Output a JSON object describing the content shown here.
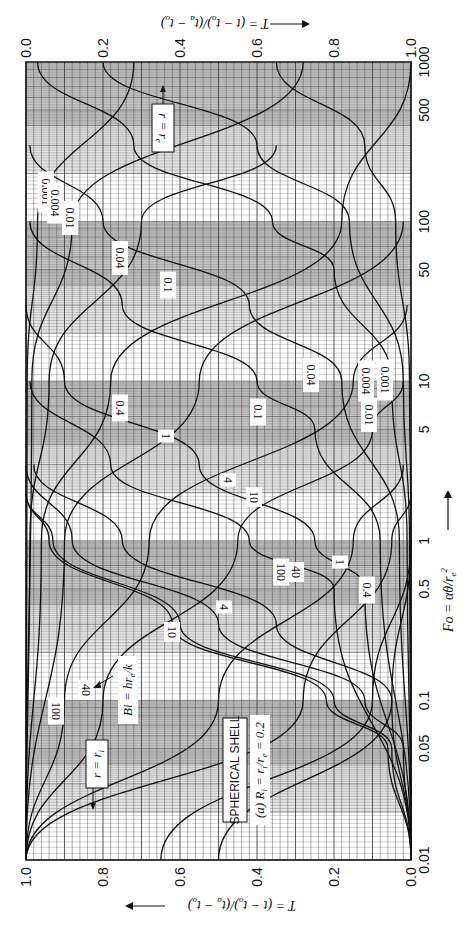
{
  "chart_data": {
    "type": "line",
    "orientation": "rotated-90-cw",
    "title": "SPHERICAL SHELL",
    "subtitle": "(a) R_i = r_i/r_e = 0.2",
    "parameter_label": "Bi = h r_e / k",
    "xlabel": "Fo = αθ/r_e²",
    "x_scale": "log",
    "xlim": [
      0.01,
      1000
    ],
    "x_ticks": [
      "0.01",
      "0.05",
      "0.1",
      "0.5",
      "1",
      "5",
      "10",
      "50",
      "100",
      "500",
      "1000"
    ],
    "ylabel_bottom": "T = (t − t_o)/(t_a − t_o)",
    "ylabel_top": "T = (t − t_o)/(t_a − t_o)",
    "y_ticks_bottom": [
      "1.0",
      "0.8",
      "0.6",
      "0.4",
      "0.2",
      "0.0"
    ],
    "y_ticks_top": [
      "0.0",
      "0.2",
      "0.4",
      "0.6",
      "0.8",
      "1.0"
    ],
    "ylim": [
      0,
      1
    ],
    "grid": true,
    "shaded_bands": "alternating decades",
    "curve_families": [
      {
        "name": "r = r_i",
        "label": "r = r_i",
        "axis": "bottom (T increases right to left)",
        "series": [
          {
            "name": "Bi=0.001",
            "x": [
              0.01,
              1,
              10,
              100,
              300,
              1000
            ],
            "y": [
              0.0,
              0.0,
              0.004,
              0.04,
              0.12,
              0.35
            ]
          },
          {
            "name": "Bi=0.004",
            "x": [
              0.01,
              1,
              10,
              100,
              300,
              1000
            ],
            "y": [
              0.0,
              0.004,
              0.02,
              0.16,
              0.4,
              0.8
            ]
          },
          {
            "name": "Bi=0.01",
            "x": [
              0.01,
              1,
              10,
              50,
              100,
              300,
              1000
            ],
            "y": [
              0.0,
              0.01,
              0.05,
              0.2,
              0.36,
              0.72,
              0.97
            ]
          },
          {
            "name": "Bi=0.04",
            "x": [
              0.01,
              1,
              10,
              30,
              100,
              300
            ],
            "y": [
              0.0,
              0.03,
              0.18,
              0.42,
              0.8,
              0.99
            ]
          },
          {
            "name": "Bi=0.1",
            "x": [
              0.01,
              1,
              5,
              10,
              30,
              100
            ],
            "y": [
              0.0,
              0.08,
              0.25,
              0.4,
              0.75,
              0.99
            ]
          },
          {
            "name": "Bi=0.4",
            "x": [
              0.01,
              0.5,
              1,
              3,
              10,
              30
            ],
            "y": [
              0.0,
              0.12,
              0.25,
              0.55,
              0.9,
              1.0
            ]
          },
          {
            "name": "Bi=1",
            "x": [
              0.01,
              0.5,
              1,
              3,
              10
            ],
            "y": [
              0.0,
              0.2,
              0.42,
              0.78,
              0.99
            ]
          },
          {
            "name": "Bi=4",
            "x": [
              0.01,
              0.1,
              0.3,
              1,
              3
            ],
            "y": [
              0.0,
              0.05,
              0.35,
              0.75,
              0.98
            ]
          },
          {
            "name": "Bi=10",
            "x": [
              0.01,
              0.05,
              0.1,
              0.3,
              1,
              3
            ],
            "y": [
              0.0,
              0.02,
              0.12,
              0.5,
              0.88,
              1.0
            ]
          },
          {
            "name": "Bi=40",
            "x": [
              0.01,
              0.05,
              0.1,
              0.3,
              1,
              2
            ],
            "y": [
              0.0,
              0.05,
              0.2,
              0.6,
              0.93,
              1.0
            ]
          },
          {
            "name": "Bi=100",
            "x": [
              0.01,
              0.05,
              0.1,
              0.3,
              1,
              2
            ],
            "y": [
              0.0,
              0.06,
              0.22,
              0.62,
              0.94,
              1.0
            ]
          }
        ]
      },
      {
        "name": "r = r_e",
        "label": "r = r_e",
        "axis": "top (T increases left to right)",
        "series": [
          {
            "name": "Bi=0.001",
            "x": [
              0.01,
              10,
              100,
              1000
            ],
            "y": [
              0.0,
              0.003,
              0.03,
              0.28
            ]
          },
          {
            "name": "Bi=0.004",
            "x": [
              0.01,
              10,
              100,
              1000
            ],
            "y": [
              0.0,
              0.015,
              0.12,
              0.72
            ]
          },
          {
            "name": "Bi=0.01",
            "x": [
              0.01,
              1,
              10,
              100,
              300
            ],
            "y": [
              0.0,
              0.01,
              0.06,
              0.3,
              0.65
            ]
          },
          {
            "name": "Bi=0.04",
            "x": [
              0.01,
              1,
              10,
              100,
              1000
            ],
            "y": [
              0.0,
              0.04,
              0.22,
              0.82,
              1.0
            ]
          },
          {
            "name": "Bi=0.1",
            "x": [
              0.01,
              1,
              10,
              100
            ],
            "y": [
              0.0,
              0.1,
              0.45,
              0.98
            ]
          },
          {
            "name": "Bi=0.4",
            "x": [
              0.01,
              0.1,
              1,
              10,
              30
            ],
            "y": [
              0.0,
              0.1,
              0.32,
              0.85,
              0.99
            ]
          },
          {
            "name": "Bi=1",
            "x": [
              0.01,
              0.1,
              1,
              5,
              10
            ],
            "y": [
              0.0,
              0.2,
              0.55,
              0.9,
              0.98
            ]
          },
          {
            "name": "Bi=4",
            "x": [
              0.01,
              0.1,
              1,
              3
            ],
            "y": [
              0.0,
              0.5,
              0.85,
              0.98
            ]
          },
          {
            "name": "Bi=10",
            "x": [
              0.01,
              0.1,
              1,
              2
            ],
            "y": [
              0.0,
              0.72,
              0.95,
              1.0
            ]
          },
          {
            "name": "Bi=40",
            "x": [
              0.01,
              0.1,
              1
            ],
            "y": [
              0.35,
              0.9,
              1.0
            ]
          },
          {
            "name": "Bi=100",
            "x": [
              0.01,
              0.1,
              1
            ],
            "y": [
              0.5,
              0.95,
              1.0
            ]
          }
        ]
      }
    ],
    "annotations": [
      "SPHERICAL SHELL",
      "(a) R_i = r_i/r_e = 0.2",
      "Bi = hr_e/k",
      "r = r_i",
      "r = r_e"
    ]
  },
  "labels": {
    "x_axis_title": "Fo = αθ/r",
    "x_axis_sup": "e",
    "x_axis_pow": "2",
    "t_axis_title": "T = (t − t",
    "title_box": "SPHERICAL SHELL",
    "subtitle": "(a)  R",
    "bi_label": "Bi = hr",
    "r_ri": "r = r",
    "r_re": "r = r"
  },
  "curve_labels_ri": [
    {
      "text": "0.001",
      "x": 385,
      "y": 380
    },
    {
      "text": "0.004",
      "x": 366,
      "y": 381
    },
    {
      "text": "0.01",
      "x": 369,
      "y": 415
    },
    {
      "text": "0.04",
      "x": 311,
      "y": 375
    },
    {
      "text": "0.1",
      "x": 258,
      "y": 412
    },
    {
      "text": "0.4",
      "x": 367,
      "y": 590
    },
    {
      "text": "1",
      "x": 340,
      "y": 562
    },
    {
      "text": "4",
      "x": 224,
      "y": 607
    },
    {
      "text": "10",
      "x": 172,
      "y": 632
    },
    {
      "text": "40",
      "x": 86,
      "y": 690
    },
    {
      "text": "100",
      "x": 56,
      "y": 711
    }
  ],
  "curve_labels_re": [
    {
      "text": "0.001",
      "x": 46,
      "y": 192
    },
    {
      "text": "0.004",
      "x": 55,
      "y": 203
    },
    {
      "text": "0.01",
      "x": 70,
      "y": 218
    },
    {
      "text": "0.04",
      "x": 120,
      "y": 258
    },
    {
      "text": "0.1",
      "x": 168,
      "y": 285
    },
    {
      "text": "0.4",
      "x": 120,
      "y": 408
    },
    {
      "text": "1",
      "x": 166,
      "y": 436
    },
    {
      "text": "4",
      "x": 228,
      "y": 480
    },
    {
      "text": "10",
      "x": 254,
      "y": 497
    },
    {
      "text": "100",
      "x": 281,
      "y": 572
    },
    {
      "text": "40",
      "x": 296,
      "y": 572
    }
  ]
}
